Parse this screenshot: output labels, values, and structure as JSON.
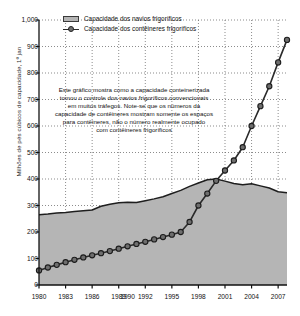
{
  "chart_data": {
    "type": "area",
    "title": "",
    "xlabel": "",
    "ylabel": "Milhões de pés cúbicos de capacidade, 1º jan",
    "ylim": [
      0,
      1000
    ],
    "xlim": [
      1980,
      2008
    ],
    "ytick_labels": [
      "0",
      "100",
      "200",
      "300",
      "400",
      "500",
      "600",
      "700",
      "800",
      "900",
      "1,000"
    ],
    "ytick_values": [
      0,
      100,
      200,
      300,
      400,
      500,
      600,
      700,
      800,
      900,
      1000
    ],
    "xtick_labels": [
      "1980",
      "1983",
      "1986",
      "1989",
      "1990",
      "1992",
      "1995",
      "1998",
      "2001",
      "2004",
      "2007"
    ],
    "xtick_values": [
      1980,
      1983,
      1986,
      1989,
      1990,
      1992,
      1995,
      1998,
      2001,
      2004,
      2007
    ],
    "grid": "dotted-both",
    "legend_position": "top-left-inside",
    "x": [
      1980,
      1981,
      1982,
      1983,
      1984,
      1985,
      1986,
      1987,
      1988,
      1989,
      1990,
      1991,
      1992,
      1993,
      1994,
      1995,
      1996,
      1997,
      1998,
      1999,
      2000,
      2001,
      2002,
      2003,
      2004,
      2005,
      2006,
      2007,
      2008
    ],
    "series": [
      {
        "name": "Capacidade dos navios frigoríficos",
        "type": "area",
        "color": "#b5b5b5",
        "line_color": "#1e1e1e",
        "values": [
          265,
          268,
          272,
          274,
          277,
          280,
          283,
          297,
          305,
          310,
          312,
          311,
          318,
          325,
          333,
          345,
          357,
          372,
          385,
          397,
          400,
          392,
          383,
          378,
          382,
          374,
          366,
          352,
          348
        ]
      },
      {
        "name": "Capacidade dos contêineres frigoríficos",
        "type": "line",
        "color": "#2a2a2a",
        "marker_color": "#6e6e6e",
        "values": [
          55,
          66,
          76,
          86,
          95,
          104,
          112,
          120,
          128,
          137,
          146,
          155,
          163,
          172,
          181,
          190,
          200,
          238,
          300,
          345,
          393,
          432,
          470,
          520,
          600,
          675,
          750,
          840,
          925
        ]
      }
    ],
    "annotation": {
      "lines": [
        "Este gráfico mostra como a capacidade conteinerizada",
        "tomou o controle dos navios frigoríficos convencionais",
        "em muitos tráfegos. Note-se que os números da",
        "capacidade de contêineres mostram somente os espaços",
        "para contêineres, não o número realmente ocupado",
        "com contêineres frigoríficos"
      ]
    }
  },
  "legend": {
    "items": [
      {
        "label": "Capacidade dos navios frigoríficos",
        "swatch": "area-swatch"
      },
      {
        "label": "Capacidade dos contêineres frigoríficos",
        "swatch": "line-marker-swatch"
      }
    ]
  }
}
